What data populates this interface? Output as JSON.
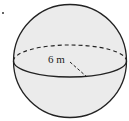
{
  "figure": {
    "type": "sphere",
    "radius_label": "6 m",
    "fill_color": "#ebebeb",
    "stroke_color": "#222222"
  }
}
